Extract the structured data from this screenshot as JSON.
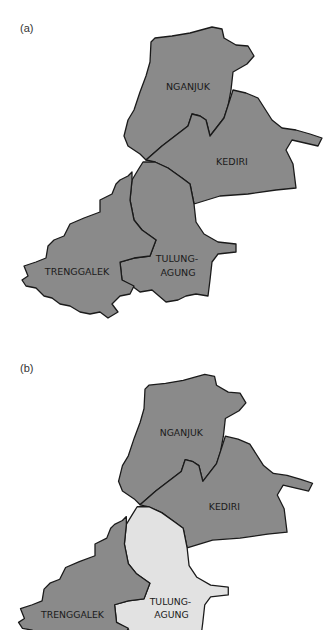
{
  "panels": [
    {
      "label": "(a)",
      "regions": [
        {
          "name": "NGANJUK",
          "lines": [
            "NGANJUK"
          ],
          "fill": "#8a8a8a"
        },
        {
          "name": "KEDIRI",
          "lines": [
            "KEDIRI"
          ],
          "fill": "#8a8a8a"
        },
        {
          "name": "TRENGGALEK",
          "lines": [
            "TRENGGALEK"
          ],
          "fill": "#8a8a8a"
        },
        {
          "name": "TULUNGAGUNG",
          "lines": [
            "TULUNG-",
            "AGUNG"
          ],
          "fill": "#8a8a8a"
        }
      ]
    },
    {
      "label": "(b)",
      "regions": [
        {
          "name": "NGANJUK",
          "lines": [
            "NGANJUK"
          ],
          "fill": "#8a8a8a"
        },
        {
          "name": "KEDIRI",
          "lines": [
            "KEDIRI"
          ],
          "fill": "#8a8a8a"
        },
        {
          "name": "TRENGGALEK",
          "lines": [
            "TRENGGALEK"
          ],
          "fill": "#8a8a8a"
        },
        {
          "name": "TULUNGAGUNG",
          "lines": [
            "TULUNG-",
            "AGUNG"
          ],
          "fill": "#e2e2e2"
        }
      ]
    }
  ],
  "colors": {
    "dark_region": "#8a8a8a",
    "highlight_region": "#e2e2e2",
    "border": "#1a1a1a"
  }
}
